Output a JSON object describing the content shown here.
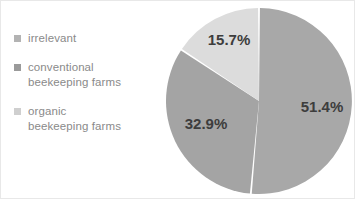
{
  "figure": {
    "background_color": "#ffffff",
    "border_color": "#e8e8e8",
    "width": 355,
    "height": 199
  },
  "legend": {
    "position": "left",
    "items": [
      {
        "label": "irrelevant",
        "color": "#b3b3b3"
      },
      {
        "label": "conventional\nbeekeeping farms",
        "color": "#9a9a9a"
      },
      {
        "label": "organic\nbeekeeping farms",
        "color": "#cfcfcf"
      }
    ]
  },
  "chart_data": {
    "type": "pie",
    "title": "",
    "subtitle": "",
    "xlabel": "",
    "ylabel": "",
    "grid": false,
    "legend_position": "left",
    "start_angle_deg": 0,
    "direction": "clockwise",
    "categories": [
      "irrelevant",
      "conventional beekeeping farms",
      "organic beekeeping farms"
    ],
    "values": [
      51.4,
      32.9,
      15.7
    ],
    "units": "percent",
    "slices": [
      {
        "name": "irrelevant",
        "value": 51.4,
        "label": "51.4%",
        "color": "#a8a8a8",
        "label_x": 321,
        "label_y": 111
      },
      {
        "name": "conventional beekeeping farms",
        "value": 32.9,
        "label": "32.9%",
        "color": "#a4a4a4",
        "label_x": 205,
        "label_y": 128
      },
      {
        "name": "organic beekeeping farms",
        "value": 15.7,
        "label": "15.7%",
        "color": "#dcdcdc",
        "label_x": 228,
        "label_y": 44
      }
    ]
  }
}
